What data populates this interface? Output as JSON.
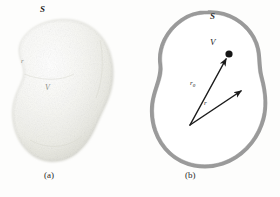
{
  "figure": {
    "background_color": "#fdfdfc"
  },
  "panels": [
    {
      "id": "a",
      "caption": "(a)",
      "description": "shaded solid blob",
      "labels": {
        "surface": "S",
        "radius": "r",
        "volume": "V"
      },
      "colors": {
        "blob_light": "#f7f7f4",
        "blob_mid": "#e9e9e3",
        "blob_shadow": "#cfcfc7",
        "outline": "#b8b8ae"
      }
    },
    {
      "id": "b",
      "caption": "(b)",
      "description": "outline blob with gray band and two vectors",
      "labels": {
        "surface": "S",
        "volume": "V",
        "vector_source": "r",
        "vector_source_sub": "0",
        "vector_field": "r"
      },
      "colors": {
        "band": "#9a9a9a",
        "band_edge": "#8b8b8b",
        "interior": "#ffffff",
        "vector": "#1b1b1b",
        "point_dot": "#151515"
      },
      "vectors": [
        {
          "name": "r0",
          "label": "r",
          "subscript": "0",
          "from": [
            50,
            125
          ],
          "to": [
            88,
            56
          ],
          "has_dot_at_tip": true
        },
        {
          "name": "r",
          "label": "r",
          "subscript": "",
          "from": [
            50,
            125
          ],
          "to": [
            103,
            90
          ],
          "has_dot_at_tip": false
        }
      ]
    }
  ]
}
